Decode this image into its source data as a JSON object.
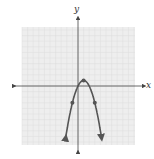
{
  "chart_data": {
    "type": "line",
    "title": "",
    "xlabel": "x",
    "ylabel": "y",
    "xlim": [
      -10,
      10
    ],
    "ylim": [
      -10,
      10
    ],
    "grid": true,
    "series": [
      {
        "name": "parabola",
        "equation": "y = -(x-1)^2 + 1",
        "x": [
          -2.2,
          -1,
          0,
          1,
          2,
          3,
          4.2
        ],
        "y": [
          -9.24,
          -3,
          0,
          1,
          0,
          -3,
          -9.24
        ],
        "marked_points": [
          [
            -1,
            -3
          ],
          [
            0,
            0
          ],
          [
            1,
            1
          ],
          [
            3,
            -3
          ]
        ]
      }
    ]
  },
  "labels": {
    "x_axis": "x",
    "y_axis": "y"
  },
  "colors": {
    "curve": "#555555",
    "grid": "#dcdcdc",
    "grid_bg": "#eeeeee",
    "axis": "#444444"
  }
}
